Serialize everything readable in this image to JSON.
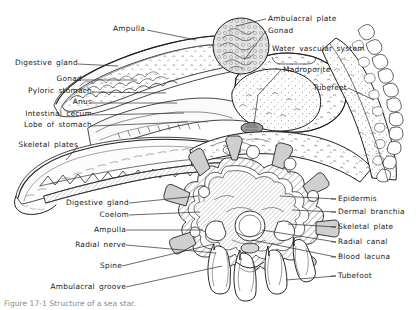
{
  "figure": {
    "caption": "Figure 17-1   Structure of a sea star."
  },
  "colors": {
    "ink": "#1a1a1a",
    "line": "#2b2b2b",
    "fill_light": "#f2f2f2",
    "fill_mid": "#d9d9d9",
    "fill_gray": "#c8c8c8",
    "background": "#ffffff"
  },
  "labels_upper_left": [
    {
      "id": "digestive-gland-upper",
      "text": "Digestive gland",
      "x": 10,
      "y": 58,
      "lead_to_x": 118,
      "lead_to_y": 66
    },
    {
      "id": "gonad-upper",
      "text": "Gonad",
      "x": 60,
      "y": 74,
      "lead_to_x": 137,
      "lead_to_y": 79
    },
    {
      "id": "pyloric-stomach",
      "text": "Pyloric stomach",
      "x": 27,
      "y": 87,
      "lead_to_x": 165,
      "lead_to_y": 93
    },
    {
      "id": "anus",
      "text": "Anus",
      "x": 73,
      "y": 99,
      "lead_to_x": 176,
      "lead_to_y": 102
    },
    {
      "id": "intestinal-cecum",
      "text": "Intestinal cecum",
      "x": 20,
      "y": 111,
      "lead_to_x": 183,
      "lead_to_y": 112
    },
    {
      "id": "lobe-of-stomach",
      "text": "Lobe of stomach",
      "x": 19,
      "y": 122,
      "lead_to_x": 186,
      "lead_to_y": 121
    },
    {
      "id": "skeletal-plates",
      "text": "Skeletal plates",
      "x": 22,
      "y": 136,
      "lead_to_x": 63,
      "lead_to_y": 160
    }
  ],
  "labels_upper_right": [
    {
      "id": "ampulla-upper",
      "text": "Ampulla",
      "x": 114,
      "y": 24,
      "lead_to_x": 192,
      "lead_to_y": 36
    },
    {
      "id": "ambulacral-plate",
      "text": "Ambulacral plate",
      "x": 268,
      "y": 15,
      "lead_to_x": 224,
      "lead_to_y": 24
    },
    {
      "id": "gonad-right",
      "text": "Gonad",
      "x": 268,
      "y": 27,
      "lead_to_x": 243,
      "lead_to_y": 60
    },
    {
      "id": "water-vascular-system",
      "text": "Water vascular system",
      "x": 272,
      "y": 45,
      "lead_to_x": 0,
      "lead_to_y": 0
    },
    {
      "id": "madroporite",
      "text": "Madroporite",
      "x": 283,
      "y": 66,
      "lead_to_x": 252,
      "lead_to_y": 92
    },
    {
      "id": "tubefeet",
      "text": "Tubefeet",
      "x": 313,
      "y": 84,
      "lead_to_x": 372,
      "lead_to_y": 120
    }
  ],
  "labels_lower_left": [
    {
      "id": "digestive-gland-lower",
      "text": "Digestive gland",
      "x": 61,
      "y": 199,
      "lead_to_x": 197,
      "lead_to_y": 193
    },
    {
      "id": "coelom",
      "text": "Coelom",
      "x": 90,
      "y": 211,
      "lead_to_x": 198,
      "lead_to_y": 210
    },
    {
      "id": "ampulla-lower",
      "text": "Ampulla",
      "x": 86,
      "y": 226,
      "lead_to_x": 196,
      "lead_to_y": 228
    },
    {
      "id": "radial-nerve",
      "text": "Radial nerve",
      "x": 70,
      "y": 241,
      "lead_to_x": 208,
      "lead_to_y": 252
    },
    {
      "id": "spine",
      "text": "Spine",
      "x": 96,
      "y": 262,
      "lead_to_x": 210,
      "lead_to_y": 245
    },
    {
      "id": "ambulacral-groove",
      "text": "Ambulacral groove",
      "x": 47,
      "y": 283,
      "lead_to_x": 215,
      "lead_to_y": 268
    }
  ],
  "labels_lower_right": [
    {
      "id": "epidermis",
      "text": "Epidermis",
      "x": 338,
      "y": 195,
      "lead_to_x": 278,
      "lead_to_y": 199
    },
    {
      "id": "dermal-branchia",
      "text": "Dermal branchia",
      "x": 338,
      "y": 208,
      "lead_to_x": 286,
      "lead_to_y": 211
    },
    {
      "id": "skeletal-plate",
      "text": "Skeletal plate",
      "x": 338,
      "y": 223,
      "lead_to_x": 277,
      "lead_to_y": 224
    },
    {
      "id": "radial-canal",
      "text": "Radial canal",
      "x": 338,
      "y": 238,
      "lead_to_x": 262,
      "lead_to_y": 233
    },
    {
      "id": "blood-lacuna",
      "text": "Blood lacuna",
      "x": 338,
      "y": 253,
      "lead_to_x": 255,
      "lead_to_y": 243
    },
    {
      "id": "tubefoot",
      "text": "Tubefoot",
      "x": 338,
      "y": 272,
      "lead_to_x": 272,
      "lead_to_y": 277
    }
  ]
}
